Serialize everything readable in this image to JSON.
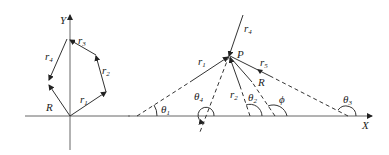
{
  "left_diagram": {
    "axis_y_label": "Y",
    "vectors": [
      {
        "name": "r",
        "sub": "1"
      },
      {
        "name": "r",
        "sub": "2"
      },
      {
        "name": "r",
        "sub": "3"
      },
      {
        "name": "r",
        "sub": "4"
      },
      {
        "name": "R",
        "sub": ""
      }
    ]
  },
  "right_diagram": {
    "axis_x_label": "X",
    "point_label": "P",
    "vectors": [
      {
        "name": "r",
        "sub": "1"
      },
      {
        "name": "r",
        "sub": "2"
      },
      {
        "name": "r",
        "sub": "4"
      },
      {
        "name": "r",
        "sub": "5"
      },
      {
        "name": "R",
        "sub": ""
      }
    ],
    "angles": [
      {
        "name": "θ",
        "sub": "1"
      },
      {
        "name": "θ",
        "sub": "2"
      },
      {
        "name": "θ",
        "sub": "3"
      },
      {
        "name": "θ",
        "sub": "4"
      },
      {
        "name": "ϕ",
        "sub": ""
      }
    ]
  },
  "colors": {
    "line": "#333333",
    "axis": "#666666",
    "text": "#222222"
  }
}
